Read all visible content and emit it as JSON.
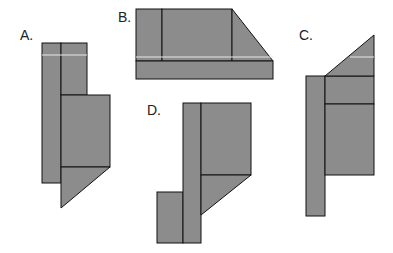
{
  "figure": {
    "fill_color": "#8c8c8c",
    "stroke_color": "#111111",
    "highlight_color": "#e8e8e8",
    "options": [
      {
        "label": "A."
      },
      {
        "label": "B."
      },
      {
        "label": "C."
      },
      {
        "label": "D."
      }
    ]
  }
}
